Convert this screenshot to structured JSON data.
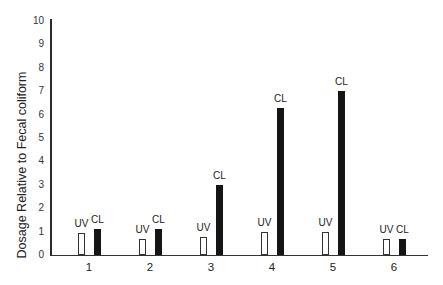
{
  "chart_data": {
    "type": "bar",
    "title": "",
    "xlabel": "",
    "ylabel": "Dosage Relative to Fecal coliform",
    "ylim": [
      0,
      10
    ],
    "yticks": [
      "0",
      "1",
      "2",
      "3",
      "4",
      "5",
      "6",
      "7",
      "8",
      "9",
      "10"
    ],
    "categories": [
      "1",
      "2",
      "3",
      "4",
      "5",
      "6"
    ],
    "series": [
      {
        "name": "UV",
        "style": "open",
        "values": [
          0.95,
          0.7,
          0.75,
          1.0,
          1.0,
          0.7
        ]
      },
      {
        "name": "CL",
        "style": "filled",
        "values": [
          1.1,
          1.1,
          3.0,
          6.3,
          7.0,
          0.7
        ]
      }
    ],
    "bar_labels": [
      "UV",
      "CL"
    ],
    "grid": false,
    "legend": "none (bars labeled directly)"
  },
  "colors": {
    "uv_fill": "#ffffff",
    "uv_stroke": "#333333",
    "cl_fill": "#151515",
    "axis": "#2a2a2a"
  }
}
